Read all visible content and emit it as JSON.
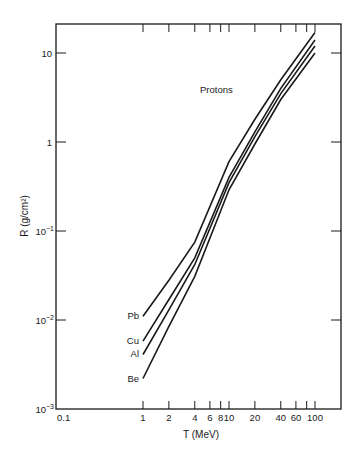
{
  "chart_data": {
    "type": "line",
    "title": "",
    "annotation": "Protons",
    "xlabel": "T (MeV)",
    "ylabel": "R (g/cm²)",
    "xscale": "log",
    "yscale": "log",
    "xlim": [
      0.1,
      200
    ],
    "ylim": [
      0.001,
      20
    ],
    "grid": false,
    "legend_position": "inline labels at left end of curves",
    "x_ticks": [
      {
        "value": 0.1,
        "label": "0.1"
      },
      {
        "value": 1,
        "label": "1"
      },
      {
        "value": 2,
        "label": "2"
      },
      {
        "value": 4,
        "label": "4"
      },
      {
        "value": 6,
        "label": "6"
      },
      {
        "value": 8,
        "label": "8"
      },
      {
        "value": 10,
        "label": "10"
      },
      {
        "value": 20,
        "label": "20"
      },
      {
        "value": 40,
        "label": "40"
      },
      {
        "value": 60,
        "label": "60"
      },
      {
        "value": 80,
        "label": ""
      },
      {
        "value": 100,
        "label": "100"
      }
    ],
    "y_ticks": [
      {
        "value": 0.001,
        "base": "10",
        "exp": "−3"
      },
      {
        "value": 0.01,
        "base": "10",
        "exp": "−2"
      },
      {
        "value": 0.1,
        "base": "10",
        "exp": "−1"
      },
      {
        "value": 1,
        "base": "1",
        "exp": ""
      },
      {
        "value": 10,
        "base": "10",
        "exp": ""
      }
    ],
    "x": [
      1,
      2,
      4,
      10,
      20,
      40,
      100
    ],
    "series": [
      {
        "name": "Pb",
        "values": [
          0.011,
          0.028,
          0.075,
          0.6,
          1.8,
          5.0,
          17
        ]
      },
      {
        "name": "Cu",
        "values": [
          0.0058,
          0.017,
          0.05,
          0.4,
          1.3,
          4.0,
          14
        ]
      },
      {
        "name": "Al",
        "values": [
          0.0041,
          0.013,
          0.042,
          0.35,
          1.15,
          3.5,
          12
        ]
      },
      {
        "name": "Be",
        "values": [
          0.0022,
          0.0085,
          0.031,
          0.29,
          0.95,
          3.0,
          10
        ]
      }
    ]
  },
  "colors": {
    "line": "#1a1a1a",
    "background": "#ffffff"
  }
}
